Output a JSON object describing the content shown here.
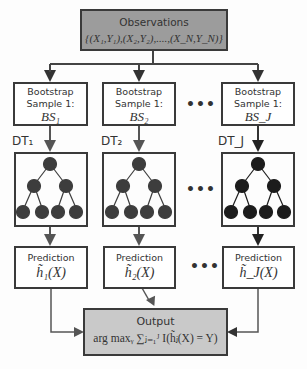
{
  "observations": {
    "title": "Observations",
    "formula": "{(X₁,Y₁),(X₂,Y₂),....,(X_N,Y_N)}"
  },
  "bootstrap": [
    {
      "line1": "Bootstrap",
      "line2": "Sample 1:",
      "math": "BS₁"
    },
    {
      "line1": "Bootstrap",
      "line2": "Sample 1:",
      "math": "BS₂"
    },
    {
      "line1": "Bootstrap",
      "line2": "Sample 1:",
      "math": "BS_J"
    }
  ],
  "trees": [
    {
      "label": "DT₁",
      "node_color": "#3d3d3d"
    },
    {
      "label": "DT₂",
      "node_color": "#3d3d3d"
    },
    {
      "label": "DT_J",
      "node_color": "#1c1c1c"
    }
  ],
  "predictions": [
    {
      "label": "Prediction",
      "math": "h̃₁(X)"
    },
    {
      "label": "Prediction",
      "math": "h̃₂(X)"
    },
    {
      "label": "Prediction",
      "math": "h̃_J(X)"
    }
  ],
  "ellipsis": "•••",
  "output": {
    "title": "Output",
    "formula": "arg max_Y Σ_{j=1}^{J} I(h̃_j(X) = Y)",
    "formula_display": "arg maxᵧ ∑ⱼ₌₁ᴶ I(h̃ⱼ(X) = Y)"
  },
  "colors": {
    "border": "#3a3a3a",
    "observations_fill": "#9c9c9c",
    "output_fill": "#c9c9c9",
    "arrow": "#444444"
  }
}
